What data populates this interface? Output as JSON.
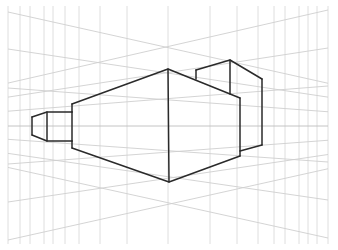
{
  "drawing": {
    "title": "Two-point perspective block sketch",
    "style": {
      "grid_color": "#d6d6d6",
      "horizon_color": "#bdbdbd",
      "line_color": "#2a2a2a",
      "background": "#ffffff"
    },
    "structures": [
      {
        "name": "main-block",
        "description": "Large central box viewed at its front vertical corner"
      },
      {
        "name": "left-annex",
        "description": "Small tapered box attached to left face"
      },
      {
        "name": "top-right-box",
        "description": "Raised box on top-right of main block"
      }
    ]
  }
}
